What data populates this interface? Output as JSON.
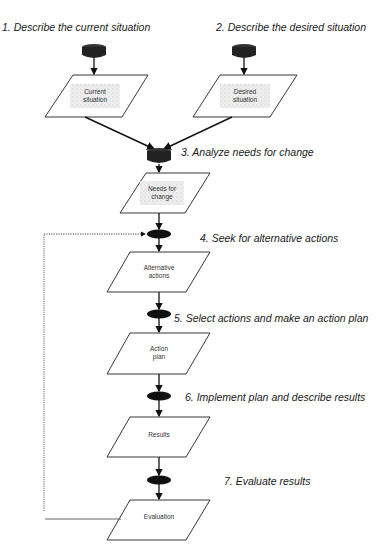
{
  "diagram": {
    "steps": [
      {
        "label": "1. Describe the current situation"
      },
      {
        "label": "2. Describe the desired situation"
      },
      {
        "label": "3. Analyze needs for change"
      },
      {
        "label": "4. Seek for alternative actions"
      },
      {
        "label": "5. Select actions and make an action plan"
      },
      {
        "label": "6. Implement plan and describe results"
      },
      {
        "label": "7. Evaluate results"
      }
    ],
    "boxes": [
      {
        "line1": "Current",
        "line2": "situation"
      },
      {
        "line1": "Desired",
        "line2": "situation"
      },
      {
        "line1": "Needs for",
        "line2": "change"
      },
      {
        "line1": "Alternative",
        "line2": "actions"
      },
      {
        "line1": "Action",
        "line2": "plan"
      },
      {
        "line1": "Results",
        "line2": ""
      },
      {
        "line1": "Evaluation",
        "line2": ""
      }
    ],
    "feedback_loop": "dotted return from Evaluation to step 4"
  }
}
